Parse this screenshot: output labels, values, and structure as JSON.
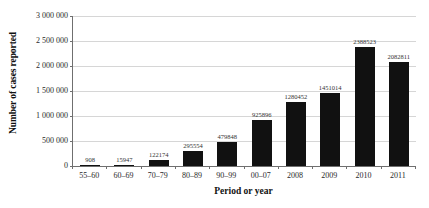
{
  "chart_data": {
    "type": "bar",
    "title": "",
    "subtitle": "",
    "xlabel": "Period or year",
    "ylabel": "Number of cases reported",
    "categories": [
      "55–60",
      "60–69",
      "70–79",
      "80–89",
      "90–99",
      "00–07",
      "2008",
      "2009",
      "2010",
      "2011"
    ],
    "values": [
      908,
      15947,
      122174,
      295554,
      479848,
      925896,
      1280452,
      1451014,
      2388523,
      2082811
    ],
    "value_labels": [
      "908",
      "15947",
      "122174",
      "295554",
      "479848",
      "925896",
      "1280452",
      "1451014",
      "2388523",
      "2082811"
    ],
    "ylim": [
      0,
      3000000
    ],
    "ytick_values": [
      0,
      500000,
      1000000,
      1500000,
      2000000,
      2500000,
      3000000
    ],
    "ytick_labels": [
      "0",
      "500 000",
      "1 000 000",
      "1 500 000",
      "2 000 000",
      "2 500 000",
      "3 000 000"
    ],
    "grid": true,
    "legend": false,
    "bar_color": "#111111",
    "gridline_color": "#d6d6d6",
    "axis_color": "#6f6f6f"
  }
}
